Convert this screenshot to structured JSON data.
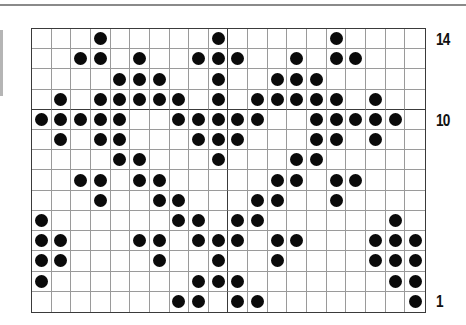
{
  "chart": {
    "type": "knitting-chart",
    "columns": 20,
    "rows": 14,
    "row_labels": [
      {
        "row": 14,
        "text": "14"
      },
      {
        "row": 10,
        "text": "10"
      },
      {
        "row": 1,
        "text": "1"
      }
    ],
    "colors": {
      "dot": "#0a0a0a",
      "grid_line": "#9a9a9a",
      "major_line": "#3a3a3a",
      "background": "#ffffff"
    },
    "filled_cells_by_row": {
      "14": [
        4,
        10,
        16
      ],
      "13": [
        3,
        4,
        6,
        9,
        10,
        11,
        14,
        16,
        17
      ],
      "12": [
        5,
        6,
        7,
        10,
        13,
        14,
        15
      ],
      "11": [
        2,
        4,
        5,
        6,
        7,
        8,
        10,
        12,
        13,
        14,
        15,
        16,
        18
      ],
      "10": [
        1,
        2,
        3,
        4,
        5,
        8,
        9,
        10,
        11,
        12,
        15,
        16,
        17,
        18,
        19
      ],
      "9": [
        2,
        4,
        5,
        9,
        10,
        11,
        15,
        16,
        18
      ],
      "8": [
        5,
        6,
        10,
        14,
        15
      ],
      "7": [
        3,
        4,
        6,
        7,
        13,
        14,
        16,
        17
      ],
      "6": [
        4,
        7,
        8,
        12,
        13,
        16
      ],
      "5": [
        1,
        8,
        9,
        11,
        12,
        19
      ],
      "4": [
        1,
        2,
        6,
        7,
        9,
        10,
        11,
        13,
        14,
        18,
        19,
        20
      ],
      "3": [
        1,
        2,
        7,
        10,
        13,
        18,
        19,
        20
      ],
      "2": [
        1,
        9,
        10,
        11,
        19,
        20
      ],
      "1": [
        8,
        9,
        11,
        12,
        20
      ]
    },
    "major_vertical_after_column": 10,
    "major_horizontal_between_rows": [
      11,
      10
    ]
  }
}
